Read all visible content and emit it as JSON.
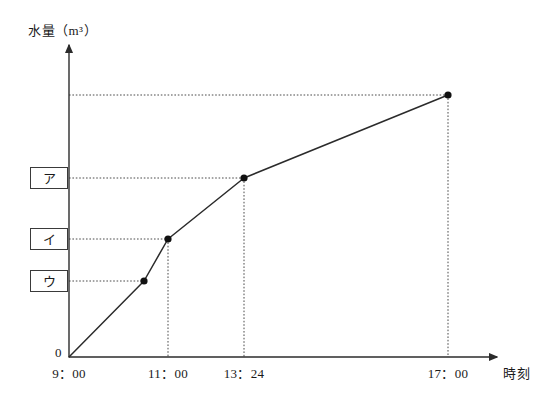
{
  "chart_data": {
    "type": "line",
    "title": "",
    "subtitle": "",
    "xlabel": "時刻",
    "ylabel": "水量（m³）",
    "origin_label": "0",
    "grid": false,
    "legend": null,
    "x_tick_labels": [
      "9：00",
      "11：00",
      "13：24",
      "17：00"
    ],
    "y_tick_labels": [
      "ア",
      "イ",
      "ウ"
    ],
    "annotations": [
      {
        "name": "ア",
        "kind": "boxed-y-label",
        "describes": "water volume at 13：24"
      },
      {
        "name": "イ",
        "kind": "boxed-y-label",
        "describes": "water volume at 11：00"
      },
      {
        "name": "ウ",
        "kind": "boxed-y-label",
        "describes": "water volume at 10：00"
      }
    ],
    "series": [
      {
        "name": "水量",
        "points": [
          {
            "x_label": "9：00",
            "px": 69,
            "py": 357,
            "marker": false,
            "h_dotted": false,
            "v_dotted": false
          },
          {
            "x_label": "",
            "px": 144,
            "py": 281,
            "marker": true,
            "h_dotted": true,
            "v_dotted": false,
            "y_tick": "ウ"
          },
          {
            "x_label": "11：00",
            "px": 168,
            "py": 239,
            "marker": true,
            "h_dotted": true,
            "v_dotted": true,
            "y_tick": "イ"
          },
          {
            "x_label": "13：24",
            "px": 244,
            "py": 178,
            "marker": true,
            "h_dotted": true,
            "v_dotted": true,
            "y_tick": "ア"
          },
          {
            "x_label": "17：00",
            "px": 448,
            "py": 95,
            "marker": true,
            "h_dotted": true,
            "v_dotted": true
          }
        ]
      }
    ],
    "axis_px": {
      "x_axis_y": 357,
      "y_axis_x": 69,
      "x_axis_end": 497,
      "y_axis_end": 45
    },
    "colors": {
      "line": "#2b2b2b",
      "axis": "#2b2b2b",
      "dotted": "#4a4a4a",
      "marker": "#111111",
      "background": "#ffffff"
    }
  }
}
